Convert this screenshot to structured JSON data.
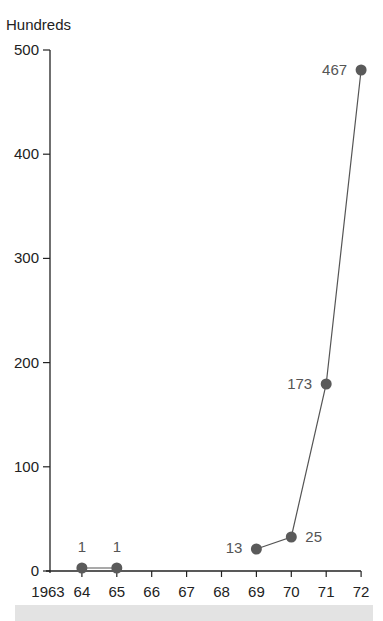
{
  "chart_data": {
    "type": "line",
    "title": "",
    "xlabel": "",
    "ylabel": "Hundreds",
    "ylim": [
      0,
      500
    ],
    "yticks": [
      0,
      100,
      200,
      300,
      400,
      500
    ],
    "xtick_labels": [
      "1963",
      "64",
      "65",
      "66",
      "67",
      "68",
      "69",
      "70",
      "71",
      "72"
    ],
    "grid": false,
    "legend": null,
    "series": [
      {
        "name": "segment-1",
        "x": [
          "64",
          "65"
        ],
        "values": [
          1,
          1
        ],
        "labels": [
          "1",
          "1"
        ]
      },
      {
        "name": "segment-2",
        "x": [
          "69",
          "70",
          "71",
          "72"
        ],
        "values": [
          13,
          25,
          173,
          467
        ],
        "labels": [
          "13",
          "25",
          "173",
          "467"
        ]
      }
    ],
    "colors": {
      "line": "#555555",
      "marker": "#5a5a5a",
      "axis": "#222222"
    }
  }
}
